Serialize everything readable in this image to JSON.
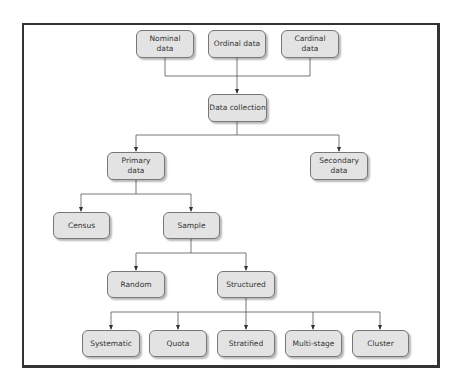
{
  "diagram": {
    "type": "hierarchy",
    "nodes": {
      "nominal": "Nominal\ndata",
      "ordinal": "Ordinal data",
      "cardinal": "Cardinal\ndata",
      "data_collection": "Data collection",
      "primary": "Primary\ndata",
      "secondary": "Secondary\ndata",
      "census": "Census",
      "sample": "Sample",
      "random": "Random",
      "structured": "Structured",
      "systematic": "Systematic",
      "quota": "Quota",
      "stratified": "Stratified",
      "multistage": "Multi-stage",
      "cluster": "Cluster"
    },
    "edges": [
      [
        "Nominal data",
        "Data collection"
      ],
      [
        "Ordinal data",
        "Data collection"
      ],
      [
        "Cardinal data",
        "Data collection"
      ],
      [
        "Data collection",
        "Primary data"
      ],
      [
        "Data collection",
        "Secondary data"
      ],
      [
        "Primary data",
        "Census"
      ],
      [
        "Primary data",
        "Sample"
      ],
      [
        "Sample",
        "Random"
      ],
      [
        "Sample",
        "Structured"
      ],
      [
        "Structured",
        "Systematic"
      ],
      [
        "Structured",
        "Quota"
      ],
      [
        "Structured",
        "Stratified"
      ],
      [
        "Structured",
        "Multi-stage"
      ],
      [
        "Structured",
        "Cluster"
      ]
    ]
  }
}
